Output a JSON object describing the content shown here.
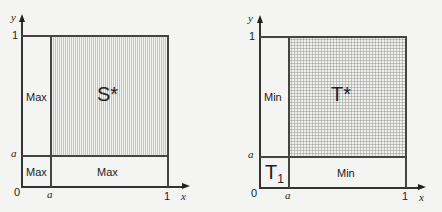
{
  "left": {
    "axis_y_label": "y",
    "axis_x_label": "x",
    "origin_label": "0",
    "tick_one_y": "1",
    "tick_one_x": "1",
    "tick_a_y": "a",
    "tick_a_x": "a",
    "region_big_label": "S*",
    "region_left_label": "Max",
    "region_corner_label": "Max",
    "region_bottom_label": "Max",
    "fill_pattern": "vertical-stripes"
  },
  "right": {
    "axis_y_label": "y",
    "axis_x_label": "x",
    "origin_label": "0",
    "tick_one_y": "1",
    "tick_one_x": "1",
    "tick_a_y": "a",
    "tick_a_x": "a",
    "region_big_label": "T*",
    "region_left_label": "Min",
    "region_corner_label_main": "T",
    "region_corner_label_sub": "1",
    "region_bottom_label": "Min",
    "fill_pattern": "dot-grid"
  },
  "colors": {
    "background": "#f4f4f2",
    "lines": "#444444",
    "text": "#222222"
  }
}
